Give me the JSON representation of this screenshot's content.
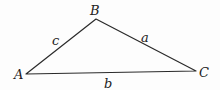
{
  "diagram": {
    "type": "triangle",
    "colors": {
      "stroke": "#2a2a2a",
      "text": "#222222",
      "background": "#fdfdfd"
    },
    "vertices": [
      {
        "id": "A",
        "label": "A",
        "x": 26,
        "y": 74,
        "label_x": 14,
        "label_y": 79
      },
      {
        "id": "B",
        "label": "B",
        "x": 96,
        "y": 19,
        "label_x": 90,
        "label_y": 15
      },
      {
        "id": "C",
        "label": "C",
        "x": 196,
        "y": 71,
        "label_x": 199,
        "label_y": 77
      }
    ],
    "sides": [
      {
        "id": "a",
        "label": "a",
        "from": "B",
        "to": "C",
        "label_x": 141,
        "label_y": 42
      },
      {
        "id": "b",
        "label": "b",
        "from": "A",
        "to": "C",
        "label_x": 104,
        "label_y": 88
      },
      {
        "id": "c",
        "label": "c",
        "from": "A",
        "to": "B",
        "label_x": 52,
        "label_y": 45
      }
    ]
  }
}
